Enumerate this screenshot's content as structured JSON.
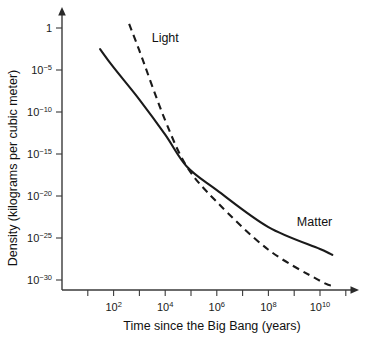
{
  "chart_data": {
    "type": "line",
    "title": "",
    "xlabel": "Time since the Big Bang (years)",
    "ylabel": "Density (kilograms per cubic meter)",
    "xscale": "log",
    "yscale": "log",
    "xlim": [
      1,
      100000000000
    ],
    "ylim": [
      1e-32,
      10
    ],
    "grid": false,
    "legend_position": "inline-annotations",
    "x_tick_labels": [
      "10²",
      "10⁴",
      "10⁶",
      "10⁸",
      "10¹⁰"
    ],
    "x_tick_values": [
      100,
      10000,
      1000000,
      100000000,
      10000000000
    ],
    "x_tick_mantissa": [
      "10",
      "10",
      "10",
      "10",
      "10"
    ],
    "x_tick_exponents": [
      "2",
      "4",
      "6",
      "8",
      "10"
    ],
    "x_minor_tick_exponents": [
      1,
      2,
      3,
      4,
      5,
      6,
      7,
      8,
      9,
      10,
      11
    ],
    "y_tick_labels": [
      "1",
      "10⁻⁵",
      "10⁻¹⁰",
      "10⁻¹⁵",
      "10⁻²⁰",
      "10⁻²⁵",
      "10⁻³⁰"
    ],
    "y_tick_mantissa": [
      "1",
      "10",
      "10",
      "10",
      "10",
      "10",
      "10"
    ],
    "y_tick_exponents": [
      "",
      "−5",
      "−10",
      "−15",
      "−20",
      "−25",
      "−30"
    ],
    "y_tick_values": [
      1,
      1e-05,
      1e-10,
      1e-15,
      1e-20,
      1e-25,
      1e-30
    ],
    "crossover": {
      "x_years": 70000,
      "y_density": 3e-17,
      "note": "matter-radiation equality: curves intersect"
    },
    "series": [
      {
        "name": "Matter",
        "label": "Matter",
        "style": "solid",
        "color": "#1a1a1a",
        "points": [
          {
            "x": 30,
            "y": 0.003
          },
          {
            "x": 100,
            "y": 2e-05
          },
          {
            "x": 1000,
            "y": 3e-09
          },
          {
            "x": 10000,
            "y": 2e-13
          },
          {
            "x": 70000,
            "y": 3e-17
          },
          {
            "x": 1000000,
            "y": 5e-20
          },
          {
            "x": 100000000,
            "y": 2e-24
          },
          {
            "x": 10000000000,
            "y": 5e-27
          },
          {
            "x": 30000000000,
            "y": 1e-27
          }
        ],
        "label_position": {
          "x_years": 30000000000,
          "y_density": 3e-24
        }
      },
      {
        "name": "Light",
        "label": "Light",
        "style": "dashed",
        "color": "#1a1a1a",
        "points": [
          {
            "x": 400,
            "y": 3.0
          },
          {
            "x": 1000,
            "y": 0.002
          },
          {
            "x": 10000,
            "y": 1e-11
          },
          {
            "x": 70000,
            "y": 3e-17
          },
          {
            "x": 1000000,
            "y": 2e-21
          },
          {
            "x": 100000000,
            "y": 4e-27
          },
          {
            "x": 10000000000,
            "y": 8e-31
          },
          {
            "x": 30000000000,
            "y": 2e-31
          }
        ],
        "label_position": {
          "x_years": 3000,
          "y_density": 0.02
        }
      }
    ],
    "annotations": [
      {
        "text": "Light",
        "name": "light-curve-label"
      },
      {
        "text": "Matter",
        "name": "matter-curve-label"
      }
    ]
  }
}
